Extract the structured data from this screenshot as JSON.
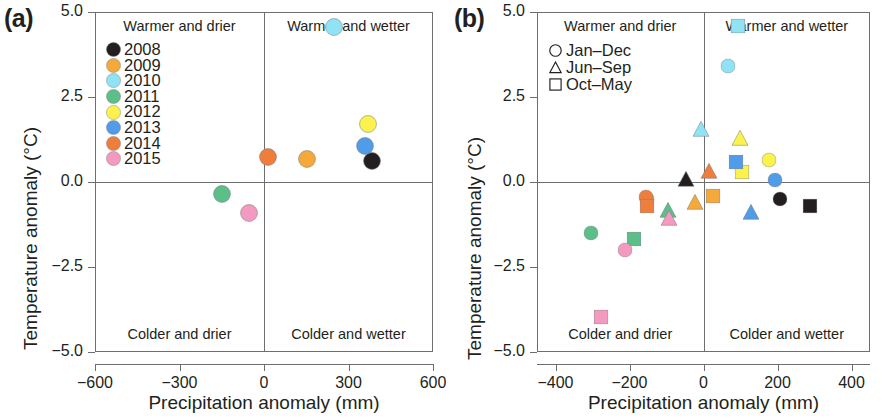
{
  "figure": {
    "panels": [
      {
        "tag": "(a)",
        "xlabel": "Precipitation anomaly (mm)",
        "ylabel": "Temperature anomaly (°C)"
      },
      {
        "tag": "(b)",
        "xlabel": "Precipitation anomaly (mm)",
        "ylabel": "Temperature anomaly (°C)"
      }
    ],
    "quadrant_labels": {
      "top_left": "Warmer and drier",
      "top_right": "Warmer and wetter",
      "bottom_left": "Colder and drier",
      "bottom_right": "Colder and wetter"
    }
  },
  "colors": {
    "2008": "#231f20",
    "2009": "#f5a93b",
    "2010": "#8fe3f5",
    "2011": "#5cbf8a",
    "2012": "#fbf24e",
    "2013": "#519ce8",
    "2014": "#ef7d3c",
    "2015": "#f49ac1",
    "axis": "#6d6e71",
    "text": "#231f20"
  },
  "chart_data": [
    {
      "panel": "a",
      "type": "scatter",
      "title": "(a)",
      "xlabel": "Precipitation anomaly (mm)",
      "ylabel": "Temperature anomaly (°C)",
      "xlim": [
        -600,
        600
      ],
      "ylim": [
        -5.0,
        5.0
      ],
      "xticks": [
        -600,
        -300,
        0,
        300,
        600
      ],
      "xticklabels": [
        "−600",
        "−300",
        "0",
        "300",
        "600"
      ],
      "yticks": [
        5.0,
        2.5,
        0.0,
        -2.5,
        -5.0
      ],
      "yticklabels": [
        "5.0",
        "2.5",
        "0.0",
        "−2.5",
        "−5.0"
      ],
      "grid": false,
      "reference_lines": {
        "x": 0,
        "y": 0
      },
      "legend_position": "top-left",
      "legend_title": "",
      "legend": [
        {
          "label": "2008",
          "color": "#231f20",
          "marker": "circle"
        },
        {
          "label": "2009",
          "color": "#f5a93b",
          "marker": "circle"
        },
        {
          "label": "2010",
          "color": "#8fe3f5",
          "marker": "circle"
        },
        {
          "label": "2011",
          "color": "#5cbf8a",
          "marker": "circle"
        },
        {
          "label": "2012",
          "color": "#fbf24e",
          "marker": "circle"
        },
        {
          "label": "2013",
          "color": "#519ce8",
          "marker": "circle"
        },
        {
          "label": "2014",
          "color": "#ef7d3c",
          "marker": "circle"
        },
        {
          "label": "2015",
          "color": "#f49ac1",
          "marker": "circle"
        }
      ],
      "points": [
        {
          "series": "2008",
          "marker": "circle",
          "color": "#231f20",
          "x": 383,
          "y": 0.63,
          "size": 18
        },
        {
          "series": "2009",
          "marker": "circle",
          "color": "#f5a93b",
          "x": 152,
          "y": 0.68,
          "size": 18
        },
        {
          "series": "2010",
          "marker": "circle",
          "color": "#8fe3f5",
          "x": 248,
          "y": 4.55,
          "size": 18
        },
        {
          "series": "2011",
          "marker": "circle",
          "color": "#5cbf8a",
          "x": -148,
          "y": -0.35,
          "size": 18
        },
        {
          "series": "2012",
          "marker": "circle",
          "color": "#fbf24e",
          "x": 368,
          "y": 1.72,
          "size": 18
        },
        {
          "series": "2013",
          "marker": "circle",
          "color": "#519ce8",
          "x": 358,
          "y": 1.07,
          "size": 18
        },
        {
          "series": "2014",
          "marker": "circle",
          "color": "#ef7d3c",
          "x": 14,
          "y": 0.75,
          "size": 18
        },
        {
          "series": "2015",
          "marker": "circle",
          "color": "#f49ac1",
          "x": -52,
          "y": -0.9,
          "size": 18
        }
      ]
    },
    {
      "panel": "b",
      "type": "scatter",
      "title": "(b)",
      "xlabel": "Precipitation anomaly (mm)",
      "ylabel": "Temperature anomaly (°C)",
      "xlim": [
        -450,
        450
      ],
      "ylim": [
        -5.0,
        5.0
      ],
      "xticks": [
        -400,
        -200,
        0,
        200,
        400
      ],
      "xticklabels": [
        "−400",
        "−200",
        "0",
        "200",
        "400"
      ],
      "yticks": [
        5.0,
        2.5,
        0.0,
        -2.5,
        -5.0
      ],
      "yticklabels": [
        "5.0",
        "2.5",
        "0.0",
        "−2.5",
        "−5.0"
      ],
      "grid": false,
      "reference_lines": {
        "x": 0,
        "y": 0
      },
      "legend_position": "top-left",
      "legend": [
        {
          "label": "Jan–Dec",
          "marker": "circle"
        },
        {
          "label": "Jun–Sep",
          "marker": "triangle"
        },
        {
          "label": "Oct–May",
          "marker": "square"
        }
      ],
      "points": [
        {
          "series": "2008",
          "season": "Jan–Dec",
          "marker": "circle",
          "color": "#231f20",
          "x": 207,
          "y": -0.5,
          "size": 15
        },
        {
          "series": "2008",
          "season": "Jun–Sep",
          "marker": "triangle",
          "color": "#231f20",
          "x": -47,
          "y": 0.1,
          "size": 17
        },
        {
          "series": "2008",
          "season": "Oct–May",
          "marker": "square",
          "color": "#231f20",
          "x": 288,
          "y": -0.72,
          "size": 15
        },
        {
          "series": "2009",
          "season": "Jan–Dec",
          "marker": "circle",
          "color": "#f5a93b",
          "x": -152,
          "y": -0.5,
          "size": 15
        },
        {
          "series": "2009",
          "season": "Jun–Sep",
          "marker": "triangle",
          "color": "#f5a93b",
          "x": -22,
          "y": -0.58,
          "size": 17
        },
        {
          "series": "2009",
          "season": "Oct–May",
          "marker": "square",
          "color": "#f5a93b",
          "x": 25,
          "y": -0.4,
          "size": 15
        },
        {
          "series": "2010",
          "season": "Jan–Dec",
          "marker": "circle",
          "color": "#8fe3f5",
          "x": 67,
          "y": 3.42,
          "size": 15
        },
        {
          "series": "2010",
          "season": "Jun–Sep",
          "marker": "triangle",
          "color": "#8fe3f5",
          "x": -8,
          "y": 1.55,
          "size": 17
        },
        {
          "series": "2010",
          "season": "Oct–May",
          "marker": "square",
          "color": "#8fe3f5",
          "x": 93,
          "y": 4.58,
          "size": 15
        },
        {
          "series": "2011",
          "season": "Jan–Dec",
          "marker": "circle",
          "color": "#5cbf8a",
          "x": -305,
          "y": -1.5,
          "size": 15
        },
        {
          "series": "2011",
          "season": "Jun–Sep",
          "marker": "triangle",
          "color": "#5cbf8a",
          "x": -97,
          "y": -0.82,
          "size": 17
        },
        {
          "series": "2011",
          "season": "Oct–May",
          "marker": "square",
          "color": "#5cbf8a",
          "x": -188,
          "y": -1.68,
          "size": 15
        },
        {
          "series": "2012",
          "season": "Jan–Dec",
          "marker": "circle",
          "color": "#fbf24e",
          "x": 178,
          "y": 0.65,
          "size": 15
        },
        {
          "series": "2012",
          "season": "Jun–Sep",
          "marker": "triangle",
          "color": "#fbf24e",
          "x": 98,
          "y": 1.3,
          "size": 17
        },
        {
          "series": "2012",
          "season": "Oct–May",
          "marker": "square",
          "color": "#fbf24e",
          "x": 105,
          "y": 0.3,
          "size": 15
        },
        {
          "series": "2013",
          "season": "Jan–Dec",
          "marker": "circle",
          "color": "#519ce8",
          "x": 193,
          "y": 0.05,
          "size": 15
        },
        {
          "series": "2013",
          "season": "Jun–Sep",
          "marker": "triangle",
          "color": "#519ce8",
          "x": 128,
          "y": -0.88,
          "size": 17
        },
        {
          "series": "2013",
          "season": "Oct–May",
          "marker": "square",
          "color": "#519ce8",
          "x": 88,
          "y": 0.58,
          "size": 15
        },
        {
          "series": "2014",
          "season": "Jan–Dec",
          "marker": "circle",
          "color": "#ef7d3c",
          "x": -155,
          "y": -0.45,
          "size": 15
        },
        {
          "series": "2014",
          "season": "Jun–Sep",
          "marker": "triangle",
          "color": "#ef7d3c",
          "x": 14,
          "y": 0.32,
          "size": 17
        },
        {
          "series": "2014",
          "season": "Oct–May",
          "marker": "square",
          "color": "#ef7d3c",
          "x": -152,
          "y": -0.72,
          "size": 15
        },
        {
          "series": "2015",
          "season": "Jan–Dec",
          "marker": "circle",
          "color": "#f49ac1",
          "x": -212,
          "y": -2.0,
          "size": 15
        },
        {
          "series": "2015",
          "season": "Jun–Sep",
          "marker": "triangle",
          "color": "#f49ac1",
          "x": -92,
          "y": -1.05,
          "size": 17
        },
        {
          "series": "2015",
          "season": "Oct–May",
          "marker": "square",
          "color": "#f49ac1",
          "x": -277,
          "y": -3.98,
          "size": 15
        }
      ]
    }
  ]
}
